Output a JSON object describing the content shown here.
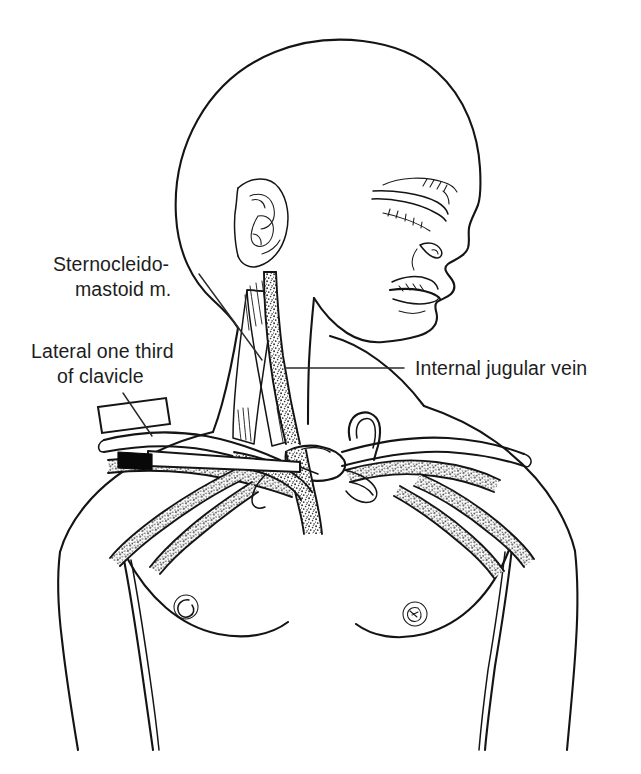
{
  "figure": {
    "title": "Central venous access anatomy of the neck and upper chest",
    "style": "black and white medical line illustration with stippled vessels",
    "background_color": "#ffffff",
    "line_color": "#141414",
    "stipple_color": "#3a3a3a",
    "needle_hub_color": "#080808",
    "canvas": {
      "width": 641,
      "height": 774
    }
  },
  "labels": [
    {
      "id": "sternocleidomastoid",
      "line1": "Sternocleido-",
      "line2": "mastoid m.",
      "x": 53,
      "y": 271,
      "align": "start",
      "leader": "diagonal line from label down-right to the sternocleidomastoid muscle belly"
    },
    {
      "id": "lateral-clavicle",
      "line1": "Lateral one third",
      "line2": "of clavicle",
      "x": 31,
      "y": 358,
      "align": "start",
      "leader": "diagonal line from label down-right to bracket on the lateral clavicle"
    },
    {
      "id": "internal-jugular-vein",
      "line1": "Internal jugular vein",
      "line2": "",
      "x": 415,
      "y": 375,
      "align": "start",
      "leader": "horizontal line from label left to the internal jugular vein in the neck"
    }
  ],
  "anatomy": {
    "structures": [
      "skull and face in right profile",
      "ear with helix and concha",
      "closed eye with eyelashes and eyebrow",
      "nose with nostril",
      "lips",
      "neck",
      "sternocleidomastoid muscle with sternal and clavicular heads",
      "internal jugular vein",
      "right and left clavicle",
      "subclavian veins",
      "brachiocephalic veins and superior vena cava",
      "shoulders, upper arms and chest",
      "nipples",
      "pectoral folds"
    ],
    "device": {
      "name": "percutaneous catheter needle",
      "description": "needle with black hub inserted beneath the lateral third of the clavicle toward the subclavian vein"
    }
  }
}
